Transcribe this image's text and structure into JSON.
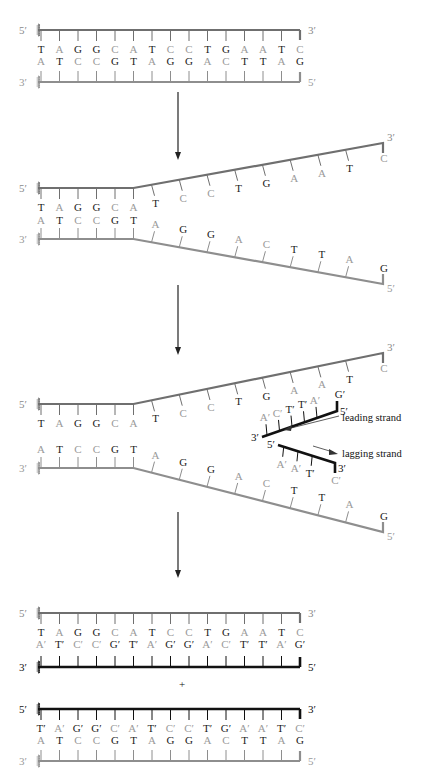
{
  "colors": {
    "old_strand": "#6f6f6f",
    "old_strand_light": "#8e8e8e",
    "new_strand": "#111111",
    "dark_base": "#1a1a1a",
    "light_base": "#9a9a9a",
    "arrow": "#222222"
  },
  "panel1": {
    "top": {
      "end5": "5′",
      "end3": "3′",
      "bases": [
        "T",
        "A",
        "G",
        "G",
        "C",
        "A",
        "T",
        "C",
        "C",
        "T",
        "G",
        "A",
        "A",
        "T",
        "C"
      ]
    },
    "bottom": {
      "end3": "3′",
      "end5": "5′",
      "bases": [
        "A",
        "T",
        "C",
        "C",
        "G",
        "T",
        "A",
        "G",
        "G",
        "A",
        "C",
        "T",
        "T",
        "A",
        "G"
      ]
    }
  },
  "panel2": {
    "top": {
      "end5": "5′",
      "end3": "3′",
      "bases": [
        "T",
        "A",
        "G",
        "G",
        "C",
        "A",
        "T",
        "C",
        "C",
        "T",
        "G",
        "A",
        "A",
        "T",
        "C"
      ]
    },
    "bottom": {
      "end3": "3′",
      "end5": "5′",
      "bases": [
        "A",
        "T",
        "C",
        "C",
        "G",
        "T",
        "A",
        "G",
        "G",
        "A",
        "C",
        "T",
        "T",
        "A",
        "G"
      ]
    }
  },
  "panel3": {
    "top": {
      "end5": "5′",
      "end3": "3′",
      "bases": [
        "T",
        "A",
        "G",
        "G",
        "C",
        "A",
        "T",
        "C",
        "C",
        "T",
        "G",
        "A",
        "A",
        "T",
        "C"
      ]
    },
    "bottom": {
      "end3": "3′",
      "end5": "5′",
      "bases": [
        "A",
        "T",
        "C",
        "C",
        "G",
        "T",
        "A",
        "G",
        "G",
        "A",
        "C",
        "T",
        "T",
        "A",
        "G"
      ]
    },
    "leading": {
      "label": "leading strand",
      "end3": "3′",
      "end5": "5′",
      "bases": [
        "A′",
        "C′",
        "T′",
        "T′",
        "A′",
        "G′"
      ]
    },
    "lagging": {
      "label": "lagging strand",
      "end5": "5′",
      "end3": "3′",
      "bases": [
        "A′",
        "A′",
        "T′",
        "C′"
      ]
    }
  },
  "panel4": {
    "plus": "+",
    "duplex1": {
      "top": {
        "end5": "5′",
        "end3": "3′",
        "bases": [
          "T",
          "A",
          "G",
          "G",
          "C",
          "A",
          "T",
          "C",
          "C",
          "T",
          "G",
          "A",
          "A",
          "T",
          "C"
        ]
      },
      "bottom": {
        "end3": "3′",
        "end5": "5′",
        "bases": [
          "A′",
          "T′",
          "C′",
          "C′",
          "G′",
          "T′",
          "A′",
          "G′",
          "G′",
          "A′",
          "C′",
          "T′",
          "T′",
          "A′",
          "G′"
        ]
      }
    },
    "duplex2": {
      "top": {
        "end5": "5′",
        "end3": "3′",
        "bases": [
          "T′",
          "A′",
          "G′",
          "G′",
          "C′",
          "A′",
          "T′",
          "C′",
          "C′",
          "T′",
          "G′",
          "A′",
          "A′",
          "T′",
          "C′"
        ]
      },
      "bottom": {
        "end3": "3′",
        "end5": "5′",
        "bases": [
          "A",
          "T",
          "C",
          "C",
          "G",
          "T",
          "A",
          "G",
          "G",
          "A",
          "C",
          "T",
          "T",
          "A",
          "G"
        ]
      }
    }
  }
}
